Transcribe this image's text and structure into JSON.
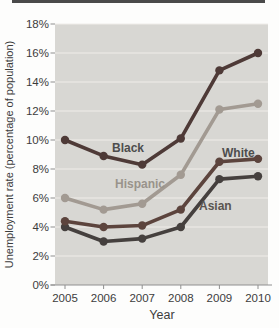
{
  "figure": {
    "top_rule_color": "#4a4a4a",
    "page_bg": "#fdfdfc"
  },
  "chart_data": {
    "type": "line",
    "title": "",
    "xlabel": "Year",
    "ylabel": "Unemployment rate (percentage of population)",
    "categories": [
      "2005",
      "2006",
      "2007",
      "2008",
      "2009",
      "2010"
    ],
    "ylim": [
      0,
      18
    ],
    "y_ticks": [
      0,
      2,
      4,
      6,
      8,
      10,
      12,
      14,
      16,
      18
    ],
    "y_tick_labels": [
      "0%",
      "2%",
      "4%",
      "6%",
      "8%",
      "10%",
      "12%",
      "14%",
      "16%",
      "18%"
    ],
    "grid": true,
    "legend_position": "inline-labels",
    "series": [
      {
        "name": "Black",
        "values": [
          10.0,
          8.9,
          8.3,
          10.1,
          14.8,
          16.0
        ],
        "color": "#4e3a37",
        "label_color": "#4d4d4d"
      },
      {
        "name": "Hispanic",
        "values": [
          6.0,
          5.2,
          5.6,
          7.6,
          12.1,
          12.5
        ],
        "color": "#a29a92",
        "label_color": "#99938b"
      },
      {
        "name": "White",
        "values": [
          4.4,
          4.0,
          4.1,
          5.2,
          8.5,
          8.7
        ],
        "color": "#5c443d",
        "label_color": "#4d4d4d"
      },
      {
        "name": "Asian",
        "values": [
          4.0,
          3.0,
          3.2,
          4.0,
          7.3,
          7.5
        ],
        "color": "#45403e",
        "label_color": "#5a5550"
      }
    ],
    "plot_bg": "#d8d7d3",
    "grid_color": "#efeeea",
    "axis_color": "#8f8f8f",
    "tick_label_color": "#3c3c3c"
  }
}
